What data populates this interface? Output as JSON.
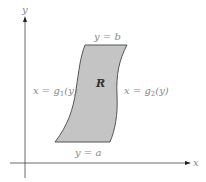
{
  "diagram": {
    "axes": {
      "x_label": "x",
      "y_label": "y"
    },
    "region_label": "R",
    "top_boundary": {
      "lhs": "y",
      "eq": " = ",
      "rhs": "b"
    },
    "bottom_boundary": {
      "lhs": "y",
      "eq": " = ",
      "rhs": "a"
    },
    "left_boundary": {
      "lhs": "x",
      "eq": " = ",
      "func": "g",
      "sub": "1",
      "arg": "(y)"
    },
    "right_boundary": {
      "lhs": "x",
      "eq": " = ",
      "func": "g",
      "sub": "2",
      "arg": "(y)"
    },
    "colors": {
      "region_fill": "#c4c4c4",
      "region_stroke": "#555555",
      "axis": "#444444",
      "label": "#888888"
    }
  }
}
